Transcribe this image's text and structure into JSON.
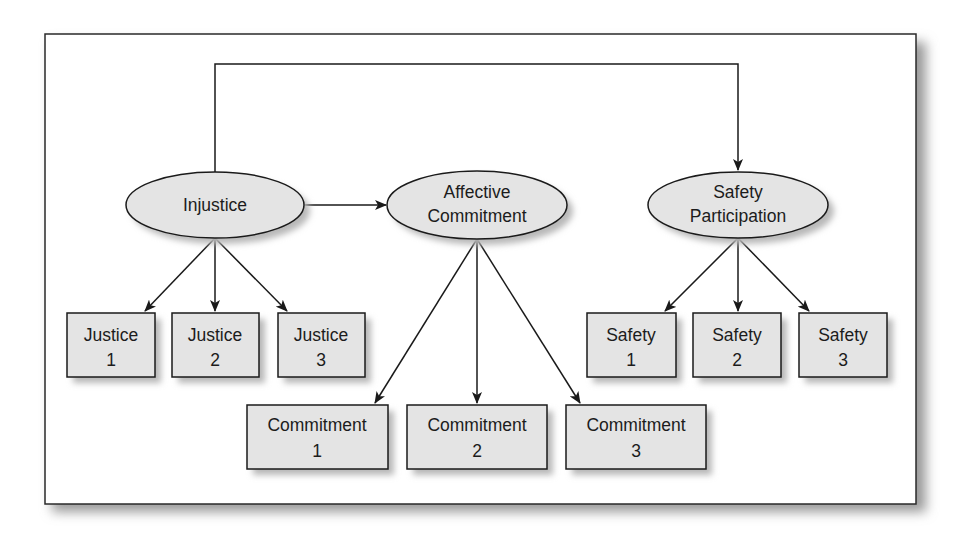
{
  "diagram": {
    "type": "structural-equation-model",
    "colors": {
      "frame_border": "#2a2a2a",
      "node_fill": "#e4e4e4",
      "node_stroke": "#1a1a1a",
      "shadow": "#b8b8b8",
      "edge": "#1a1a1a",
      "text": "#1c1c1c"
    },
    "latent_variables": [
      {
        "id": "injustice",
        "lines": [
          "Injustice"
        ]
      },
      {
        "id": "affective_commitment",
        "lines": [
          "Affective",
          "Commitment"
        ]
      },
      {
        "id": "safety_participation",
        "lines": [
          "Safety",
          "Participation"
        ]
      }
    ],
    "indicators": [
      {
        "id": "justice1",
        "parent": "injustice",
        "lines": [
          "Justice",
          "1"
        ]
      },
      {
        "id": "justice2",
        "parent": "injustice",
        "lines": [
          "Justice",
          "2"
        ]
      },
      {
        "id": "justice3",
        "parent": "injustice",
        "lines": [
          "Justice",
          "3"
        ]
      },
      {
        "id": "commitment1",
        "parent": "affective_commitment",
        "lines": [
          "Commitment",
          "1"
        ]
      },
      {
        "id": "commitment2",
        "parent": "affective_commitment",
        "lines": [
          "Commitment",
          "2"
        ]
      },
      {
        "id": "commitment3",
        "parent": "affective_commitment",
        "lines": [
          "Commitment",
          "3"
        ]
      },
      {
        "id": "safety1",
        "parent": "safety_participation",
        "lines": [
          "Safety",
          "1"
        ]
      },
      {
        "id": "safety2",
        "parent": "safety_participation",
        "lines": [
          "Safety",
          "2"
        ]
      },
      {
        "id": "safety3",
        "parent": "safety_participation",
        "lines": [
          "Safety",
          "3"
        ]
      }
    ],
    "paths": [
      {
        "from": "injustice",
        "to": "affective_commitment"
      },
      {
        "from": "injustice",
        "to": "safety_participation"
      }
    ]
  }
}
